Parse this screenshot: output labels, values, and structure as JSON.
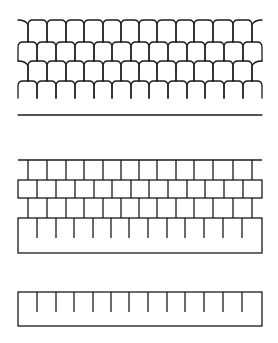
{
  "figure": {
    "width": 278,
    "height": 343,
    "stroke_color": "#1a1a1a",
    "background": "#ffffff",
    "panels": [
      {
        "name": "curved-shingle-pattern",
        "description": "Four staggered rows of rounded-top arched tiles (scalloped pattern) above a horizontal baseline",
        "x_range": [
          18,
          262
        ],
        "row_tops": [
          20,
          42,
          61,
          81
        ],
        "row_bottom": 98,
        "baseline_y": 115,
        "offset_row_vertical_x": [
          28,
          47,
          66,
          84,
          103,
          121,
          139,
          157,
          176,
          194,
          213,
          233,
          252
        ],
        "even_row_vertical_x": [
          18,
          37,
          56,
          75,
          94,
          112,
          131,
          149,
          168,
          187,
          205,
          224,
          243,
          262
        ]
      },
      {
        "name": "rectangular-block-pattern",
        "description": "Staggered rectangular blocks: open top row, boxed middle row, open third row, and an outlined base strip with hanging ticks",
        "x_range": [
          18,
          262
        ],
        "top_line_y": 160,
        "row_tops": [
          160,
          180,
          198,
          218
        ],
        "tick_end_y": 238,
        "bottom_y": 253,
        "offset_row_vertical_x": [
          28,
          47,
          66,
          84,
          103,
          121,
          139,
          157,
          176,
          194,
          213,
          233,
          252
        ],
        "even_row_vertical_x": [
          18,
          37,
          56,
          75,
          94,
          112,
          131,
          149,
          168,
          187,
          205,
          224,
          243,
          262
        ],
        "tick_x": [
          37,
          56,
          74,
          93,
          111,
          129,
          148,
          167,
          185,
          204,
          223,
          242
        ]
      },
      {
        "name": "ruler-strip",
        "description": "Single outlined rectangular strip with evenly spaced tick marks hanging from the top edge",
        "x_range": [
          18,
          262
        ],
        "top_y": 292,
        "tick_end_y": 312,
        "bottom_y": 326,
        "tick_x": [
          37,
          56,
          74,
          93,
          111,
          129,
          148,
          167,
          185,
          204,
          223,
          242
        ]
      }
    ]
  }
}
